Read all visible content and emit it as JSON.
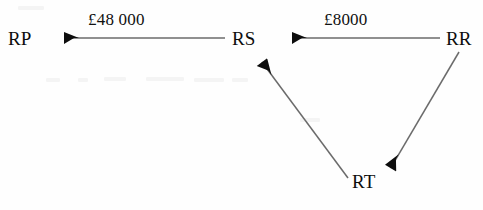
{
  "canvas": {
    "width": 483,
    "height": 210,
    "background_color": "#fefefe",
    "ink_color": "#0d0d0d",
    "line_color": "#6b6b6b"
  },
  "nodes": [
    {
      "id": "RP",
      "label": "RP",
      "x": 8,
      "y": 29
    },
    {
      "id": "RS",
      "label": "RS",
      "x": 232,
      "y": 29
    },
    {
      "id": "RR",
      "label": "RR",
      "x": 446,
      "y": 29
    },
    {
      "id": "RT",
      "label": "RT",
      "x": 352,
      "y": 172
    }
  ],
  "edges": [
    {
      "id": "rs-to-rp",
      "from": "RS",
      "to": "RP",
      "label": "£48 000",
      "label_x": 88,
      "label_y": 11,
      "x1": 225,
      "y1": 38,
      "x2": 49,
      "y2": 38
    },
    {
      "id": "rr-to-rs",
      "from": "RR",
      "to": "RS",
      "label": "£8000",
      "label_x": 324,
      "label_y": 11,
      "x1": 440,
      "y1": 38,
      "x2": 277,
      "y2": 38
    },
    {
      "id": "rr-to-rt",
      "from": "RR",
      "to": "RT",
      "label": "",
      "x1": 459,
      "y1": 52,
      "x2": 383,
      "y2": 181
    },
    {
      "id": "rt-to-rs",
      "from": "RT",
      "to": "RS",
      "label": "",
      "x1": 348,
      "y1": 178,
      "x2": 253,
      "y2": 50
    }
  ],
  "chart_data": {
    "type": "diagram",
    "title": "",
    "diagram_kind": "directed-graph",
    "currency": "GBP",
    "nodes": [
      "RP",
      "RS",
      "RR",
      "RT"
    ],
    "links": [
      {
        "source": "RS",
        "target": "RP",
        "value": 48000,
        "value_text": "£48 000"
      },
      {
        "source": "RR",
        "target": "RS",
        "value": 8000,
        "value_text": "£8000"
      },
      {
        "source": "RR",
        "target": "RT",
        "value": null,
        "value_text": ""
      },
      {
        "source": "RT",
        "target": "RS",
        "value": null,
        "value_text": ""
      }
    ]
  }
}
